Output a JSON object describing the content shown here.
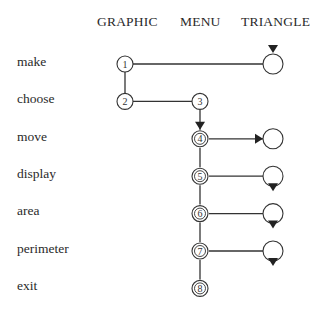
{
  "columns": [
    "GRAPHIC",
    "MENU",
    "TRIANGLE"
  ],
  "rows": [
    "make",
    "choose",
    "move",
    "display",
    "area",
    "perimeter",
    "exit"
  ],
  "nodes": [
    {
      "id": "1",
      "column": "GRAPHIC",
      "row": "make",
      "style": "single"
    },
    {
      "id": "2",
      "column": "GRAPHIC",
      "row": "choose",
      "style": "single"
    },
    {
      "id": "3",
      "column": "MENU",
      "row": "choose",
      "style": "single"
    },
    {
      "id": "4",
      "column": "MENU",
      "row": "move",
      "style": "double"
    },
    {
      "id": "5",
      "column": "MENU",
      "row": "display",
      "style": "double"
    },
    {
      "id": "6",
      "column": "MENU",
      "row": "area",
      "style": "double"
    },
    {
      "id": "7",
      "column": "MENU",
      "row": "perimeter",
      "style": "double"
    },
    {
      "id": "8",
      "column": "MENU",
      "row": "exit",
      "style": "double"
    },
    {
      "id": "t-make",
      "column": "TRIANGLE",
      "row": "make",
      "style": "empty",
      "marker": "arrow-in-top"
    },
    {
      "id": "t-move",
      "column": "TRIANGLE",
      "row": "move",
      "style": "empty",
      "marker": "arrow-in-left"
    },
    {
      "id": "t-display",
      "column": "TRIANGLE",
      "row": "display",
      "style": "empty",
      "marker": "arrow-out-bottom"
    },
    {
      "id": "t-area",
      "column": "TRIANGLE",
      "row": "area",
      "style": "empty",
      "marker": "arrow-out-bottom"
    },
    {
      "id": "t-perimeter",
      "column": "TRIANGLE",
      "row": "perimeter",
      "style": "empty",
      "marker": "arrow-out-bottom"
    }
  ],
  "edges": [
    {
      "from": "1",
      "to": "t-make"
    },
    {
      "from": "1",
      "to": "2"
    },
    {
      "from": "2",
      "to": "3"
    },
    {
      "from": "3",
      "to": "4",
      "arrow": true
    },
    {
      "from": "4",
      "to": "t-move",
      "arrow": true
    },
    {
      "from": "4",
      "to": "5"
    },
    {
      "from": "5",
      "to": "t-display"
    },
    {
      "from": "5",
      "to": "6"
    },
    {
      "from": "6",
      "to": "t-area"
    },
    {
      "from": "6",
      "to": "7"
    },
    {
      "from": "7",
      "to": "t-perimeter"
    },
    {
      "from": "7",
      "to": "8"
    }
  ]
}
